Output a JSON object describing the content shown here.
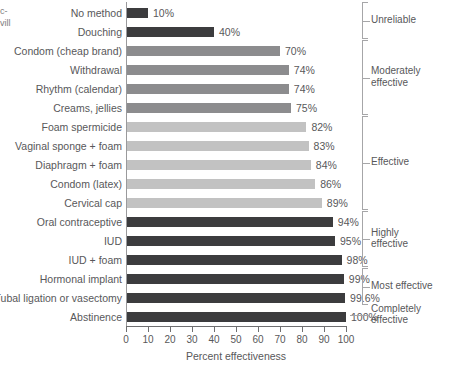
{
  "edge_fragments": {
    "line1": "c-",
    "line2": "vill"
  },
  "chart_data": {
    "type": "bar",
    "orientation": "horizontal",
    "title": "",
    "xlabel": "Percent effectiveness",
    "ylabel": "",
    "xlim": [
      0,
      100
    ],
    "xticks": [
      0,
      10,
      20,
      30,
      40,
      50,
      60,
      70,
      80,
      90,
      100
    ],
    "grid": false,
    "legend": "none",
    "categories": [
      "No method",
      "Douching",
      "Condom (cheap brand)",
      "Withdrawal",
      "Rhythm (calendar)",
      "Creams, jellies",
      "Foam spermicide",
      "Vaginal sponge + foam",
      "Diaphragm + foam",
      "Condom (latex)",
      "Cervical cap",
      "Oral contraceptive",
      "IUD",
      "IUD + foam",
      "Hormonal implant",
      "Tubal ligation or vasectomy",
      "Abstinence"
    ],
    "values": [
      10,
      40,
      70,
      74,
      74,
      75,
      82,
      83,
      84,
      86,
      89,
      94,
      95,
      98,
      99,
      99.6,
      100
    ],
    "value_labels": [
      "10%",
      "40%",
      "70%",
      "74%",
      "74%",
      "75%",
      "82%",
      "83%",
      "84%",
      "86%",
      "89%",
      "94%",
      "95%",
      "98%",
      "99%",
      "99.6%",
      "100%"
    ],
    "bar_shades": [
      "dark",
      "dark",
      "mid",
      "mid",
      "mid",
      "mid",
      "light",
      "light",
      "light",
      "light",
      "light",
      "dark",
      "dark",
      "dark",
      "dark",
      "dark",
      "dark"
    ],
    "colors": {
      "dark": "#3c3c3e",
      "mid": "#8c8c8e",
      "light": "#c2c2c2"
    },
    "annotations": [
      {
        "label": "Unreliable",
        "start_index": 0,
        "end_index": 1
      },
      {
        "label": "Moderately\neffective",
        "start_index": 2,
        "end_index": 5
      },
      {
        "label": "Effective",
        "start_index": 6,
        "end_index": 10
      },
      {
        "label": "Highly\neffective",
        "start_index": 11,
        "end_index": 13
      },
      {
        "label": "Most effective",
        "start_index": 14,
        "end_index": 15
      },
      {
        "label": "Completely\neffective",
        "start_index": 16,
        "end_index": 16
      }
    ]
  }
}
